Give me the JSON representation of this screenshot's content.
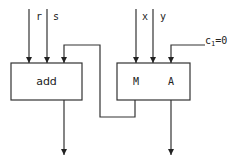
{
  "diagram": {
    "blocks": [
      {
        "id": "add",
        "label": "add"
      },
      {
        "id": "ma",
        "label_m": "M",
        "label_a": "A"
      }
    ],
    "inputs": {
      "r": "r",
      "s": "s",
      "x": "x",
      "y": "y",
      "carry_in_base": "c",
      "carry_in_sub": "1",
      "carry_in_value": "=0"
    }
  }
}
